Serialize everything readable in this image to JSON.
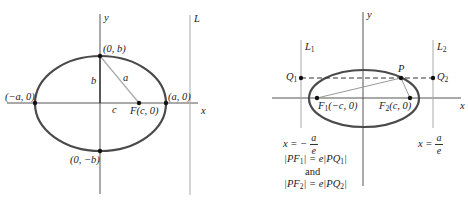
{
  "left_diagram": {
    "axes": {
      "x_label": "x",
      "y_label": "y"
    },
    "directrix_label": "L",
    "points": {
      "top_vertex": "(0, b)",
      "bottom_vertex": "(0, −b)",
      "left_vertex": "(−a, 0)",
      "right_vertex": "(a, 0)",
      "focus": "F(c, 0)"
    },
    "segments": {
      "b": "b",
      "a": "a",
      "c": "c"
    }
  },
  "right_diagram": {
    "axes": {
      "x_label": "x",
      "y_label": "y"
    },
    "directrices": {
      "L1": "L",
      "L1_sub": "1",
      "L2": "L",
      "L2_sub": "2"
    },
    "points": {
      "P": "P",
      "Q1": "Q",
      "Q1_sub": "1",
      "Q2": "Q",
      "Q2_sub": "2",
      "F1": "F",
      "F1_sub": "1",
      "F1_coords": "(−c, 0)",
      "F2": "F",
      "F2_sub": "2",
      "F2_coords": "(c, 0)"
    },
    "equations": {
      "left_directrix_lhs": "x = −",
      "left_directrix_num": "a",
      "left_directrix_den": "e",
      "right_directrix_lhs": "x =",
      "right_directrix_num": "a",
      "right_directrix_den": "e",
      "rel1_a": "|PF",
      "rel1_sub": "1",
      "rel1_b": "| = e|PQ",
      "rel1_sub2": "1",
      "rel1_c": "|",
      "and": "and",
      "rel2_a": "|PF",
      "rel2_sub": "2",
      "rel2_b": "| = e|PQ",
      "rel2_sub2": "2",
      "rel2_c": "|"
    }
  },
  "colors": {
    "ellipse": "#4a4a4a",
    "axis": "#555555",
    "thin": "#9a9a9a"
  }
}
